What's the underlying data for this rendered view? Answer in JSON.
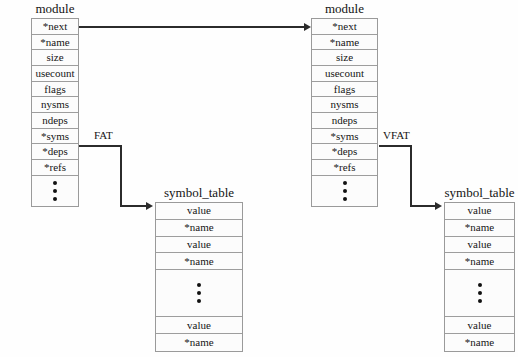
{
  "diagram": {
    "background_color": "#fefefe",
    "line_color": "#2b2b2b",
    "cell_fill": "#fcfcfc",
    "border_color": "#9a9a9a"
  },
  "structs": {
    "module_left": {
      "title": "module",
      "fields": [
        "*next",
        "*name",
        "size",
        "usecount",
        "flags",
        "nysms",
        "ndeps",
        "*syms",
        "*deps",
        "*refs"
      ],
      "continuation": "vertical-ellipsis"
    },
    "module_right": {
      "title": "module",
      "fields": [
        "*next",
        "*name",
        "size",
        "usecount",
        "flags",
        "nysms",
        "ndeps",
        "*syms",
        "*deps",
        "*refs"
      ],
      "continuation": "vertical-ellipsis"
    },
    "symbol_table_left": {
      "title": "symbol_table",
      "fields_top": [
        "value",
        "*name",
        "value",
        "*name"
      ],
      "continuation": "vertical-ellipsis",
      "fields_bottom": [
        "value",
        "*name"
      ]
    },
    "symbol_table_right": {
      "title": "symbol_table",
      "fields_top": [
        "value",
        "*name",
        "value",
        "*name"
      ],
      "continuation": "vertical-ellipsis",
      "fields_bottom": [
        "value",
        "*name"
      ]
    }
  },
  "edges": {
    "next_link": {
      "label": "",
      "from": "*next",
      "to": "*next"
    },
    "fat": {
      "label": "FAT",
      "from": "*syms",
      "to": "symbol_table"
    },
    "vfat": {
      "label": "VFAT",
      "from": "*syms",
      "to": "symbol_table"
    }
  }
}
